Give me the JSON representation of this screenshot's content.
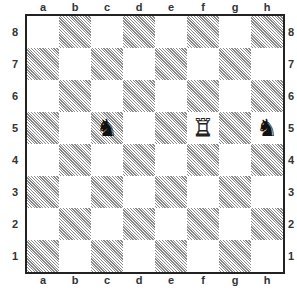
{
  "board": {
    "files": [
      "a",
      "b",
      "c",
      "d",
      "e",
      "f",
      "g",
      "h"
    ],
    "ranks": [
      "8",
      "7",
      "6",
      "5",
      "4",
      "3",
      "2",
      "1"
    ],
    "colors": {
      "light": "#ffffff",
      "dark_hatch": "#8a8a8a",
      "border": "#222222"
    },
    "pieces": [
      {
        "square": "c5",
        "type": "knight",
        "color": "black",
        "glyph": "♞"
      },
      {
        "square": "f5",
        "type": "rook",
        "color": "white",
        "glyph": "♖"
      },
      {
        "square": "h5",
        "type": "knight",
        "color": "black",
        "glyph": "♞"
      }
    ]
  },
  "margin_text": "a\n.\ni\ns\n:"
}
